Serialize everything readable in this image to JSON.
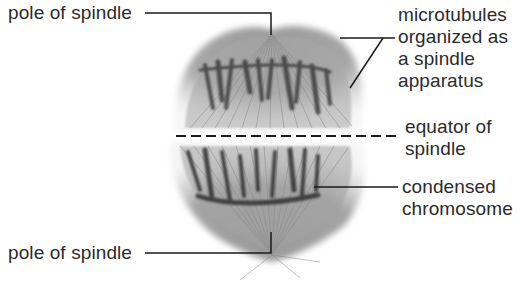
{
  "figure": {
    "labels": {
      "pole_top": "pole of spindle",
      "microtubules": [
        "microtubules",
        "organized as",
        "a spindle",
        "apparatus"
      ],
      "equator": [
        "equator of",
        "spindle"
      ],
      "chromosome": [
        "condensed",
        "chromosome"
      ],
      "pole_bottom": "pole of spindle"
    },
    "colors": {
      "text": "#2b2b2b",
      "leader_line": "#1a1a1a",
      "spindle_light": "#c9c9c9",
      "spindle_mid": "#8e8e8e",
      "chromosome_dark": "#3a3a3a"
    }
  }
}
